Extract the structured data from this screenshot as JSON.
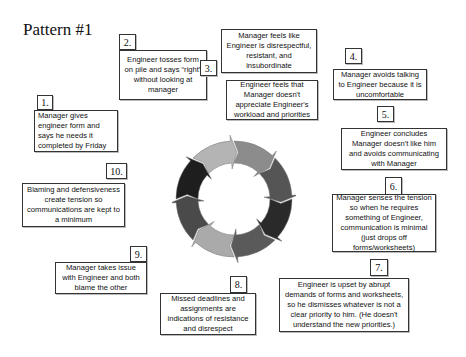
{
  "title": "Pattern #1",
  "steps": [
    {
      "number": "1.",
      "text": "Manager gives engineer form and says he needs it completed by Friday"
    },
    {
      "number": "2.",
      "text": "Engineer tosses form on pile and says “right” without looking at manager"
    },
    {
      "number": "3.",
      "text_a": "Manager feels like Engineer is disrespectful, resistant, and insubordinate",
      "text_b": "Engineer feels that Manager doesn't appreciate Engineer's workload and priorities"
    },
    {
      "number": "4.",
      "text": "Manager avoids talking to Engineer because it is uncomfortable"
    },
    {
      "number": "5.",
      "text": "Engineer concludes Manager doesn't like him and avoids communicating with Manager"
    },
    {
      "number": "6.",
      "text": "Manager senses the tension so when he requires something of Engineer, communication is minimal (just drops off forms/worksheets)"
    },
    {
      "number": "7.",
      "text": "Engineer is upset by abrupt demands of forms and worksheets, so he dismisses whatever is not a clear priority to him. (He doesn't understand the new priorities.)"
    },
    {
      "number": "8.",
      "text": "Missed deadlines and assignments are indications of resistance and disrespect"
    },
    {
      "number": "9.",
      "text": "Manager takes issue with Engineer and both blame the other"
    },
    {
      "number": "10.",
      "text": "Blaming and defensiveness create tension so communications are kept to a minimum"
    }
  ],
  "cycle": {
    "segment_colors": [
      "#b4b4b4",
      "#8c8c8c",
      "#555555",
      "#2a2a2a",
      "#5a5a5a",
      "#aaaaaa",
      "#4a4a4a",
      "#1e1e1e"
    ]
  }
}
